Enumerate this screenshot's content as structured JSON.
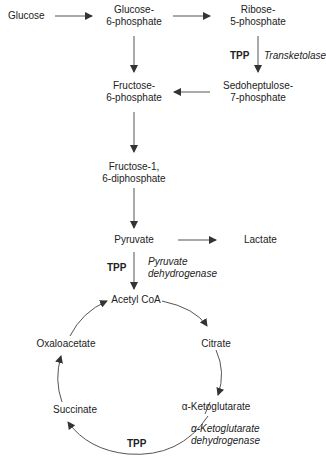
{
  "nodes": {
    "glucose": "Glucose",
    "g6p_1": "Glucose-",
    "g6p_2": "6-phosphate",
    "r5p_1": "Ribose-",
    "r5p_2": "5-phosphate",
    "s7p_1": "Sedoheptulose-",
    "s7p_2": "7-phosphate",
    "f6p_1": "Fructose-",
    "f6p_2": "6-phosphate",
    "f16dp_1": "Fructose-1,",
    "f16dp_2": "6-diphosphate",
    "pyruvate": "Pyruvate",
    "lactate": "Lactate",
    "acetyl_coa": "Acetyl CoA",
    "citrate": "Citrate",
    "akg": "α-Ketoglutarate",
    "succinate": "Succinate",
    "oxaloacetate": "Oxaloacetate"
  },
  "cofactors": {
    "tpp_transketolase": "TPP",
    "tpp_pdh": "TPP",
    "tpp_akgdh": "TPP"
  },
  "enzymes": {
    "transketolase": "Transketolase",
    "pdh_1": "Pyruvate",
    "pdh_2": "dehydrogenase",
    "akgdh_1": "α-Ketoglutarate",
    "akgdh_2": "dehydrogenase"
  },
  "colors": {
    "line": "#444444",
    "text": "#222222"
  }
}
